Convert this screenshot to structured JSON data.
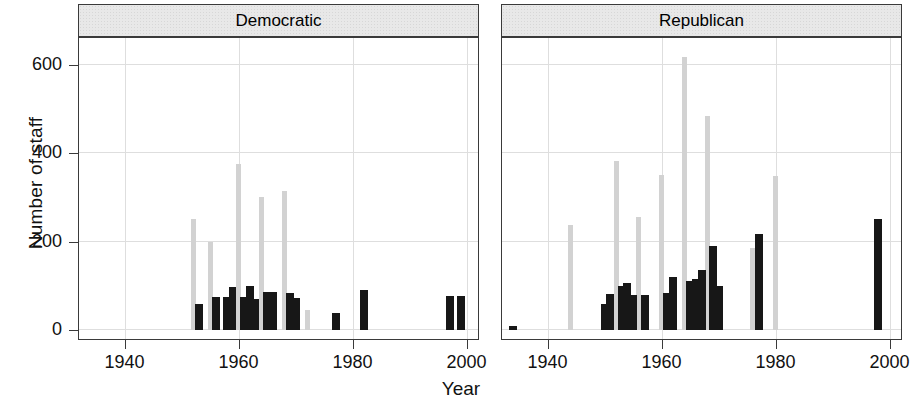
{
  "chart_data": {
    "type": "bar",
    "title": "",
    "xlabel": "Year",
    "ylabel": "Number of staff",
    "xlim": [
      1932,
      2002
    ],
    "ylim": [
      -20,
      660
    ],
    "xticks": [
      1940,
      1960,
      1980,
      2000
    ],
    "xticklabels": [
      "1940",
      "1960",
      "1980",
      "2000"
    ],
    "yticks": [
      0,
      200,
      400,
      600
    ],
    "yticklabels": [
      "0",
      "200",
      "400",
      "600"
    ],
    "grid": true,
    "legend": "none",
    "facet_variable": "party",
    "colors": {
      "light_bar": "#d2d2d2",
      "dark_bar": "#171717",
      "strip_background": "#e8e8e8",
      "border": "#3a3a3a",
      "gridline": "#dedede",
      "background": "#ffffff"
    },
    "panels": [
      {
        "label": "Democratic",
        "bars": [
          {
            "year": 1952,
            "value": 250,
            "shade": "light"
          },
          {
            "year": 1953,
            "value": 58,
            "shade": "dark"
          },
          {
            "year": 1955,
            "value": 200,
            "shade": "light"
          },
          {
            "year": 1956,
            "value": 75,
            "shade": "dark"
          },
          {
            "year": 1958,
            "value": 75,
            "shade": "dark"
          },
          {
            "year": 1959,
            "value": 98,
            "shade": "dark"
          },
          {
            "year": 1960,
            "value": 375,
            "shade": "light"
          },
          {
            "year": 1961,
            "value": 75,
            "shade": "dark"
          },
          {
            "year": 1962,
            "value": 100,
            "shade": "dark"
          },
          {
            "year": 1963,
            "value": 70,
            "shade": "dark"
          },
          {
            "year": 1964,
            "value": 300,
            "shade": "light"
          },
          {
            "year": 1965,
            "value": 86,
            "shade": "dark"
          },
          {
            "year": 1966,
            "value": 86,
            "shade": "dark"
          },
          {
            "year": 1968,
            "value": 315,
            "shade": "light"
          },
          {
            "year": 1969,
            "value": 85,
            "shade": "dark"
          },
          {
            "year": 1970,
            "value": 72,
            "shade": "dark"
          },
          {
            "year": 1972,
            "value": 45,
            "shade": "light"
          },
          {
            "year": 1977,
            "value": 38,
            "shade": "dark"
          },
          {
            "year": 1982,
            "value": 90,
            "shade": "dark"
          },
          {
            "year": 1997,
            "value": 78,
            "shade": "dark"
          },
          {
            "year": 1999,
            "value": 78,
            "shade": "dark"
          }
        ]
      },
      {
        "label": "Republican",
        "bars": [
          {
            "year": 1934,
            "value": 10,
            "shade": "dark"
          },
          {
            "year": 1944,
            "value": 237,
            "shade": "light"
          },
          {
            "year": 1950,
            "value": 58,
            "shade": "dark"
          },
          {
            "year": 1951,
            "value": 82,
            "shade": "dark"
          },
          {
            "year": 1952,
            "value": 383,
            "shade": "light"
          },
          {
            "year": 1953,
            "value": 100,
            "shade": "dark"
          },
          {
            "year": 1954,
            "value": 107,
            "shade": "dark"
          },
          {
            "year": 1956,
            "value": 255,
            "shade": "light"
          },
          {
            "year": 1955,
            "value": 80,
            "shade": "dark"
          },
          {
            "year": 1957,
            "value": 80,
            "shade": "dark"
          },
          {
            "year": 1960,
            "value": 350,
            "shade": "light"
          },
          {
            "year": 1961,
            "value": 85,
            "shade": "dark"
          },
          {
            "year": 1962,
            "value": 120,
            "shade": "dark"
          },
          {
            "year": 1964,
            "value": 617,
            "shade": "light"
          },
          {
            "year": 1965,
            "value": 112,
            "shade": "dark"
          },
          {
            "year": 1966,
            "value": 115,
            "shade": "dark"
          },
          {
            "year": 1968,
            "value": 483,
            "shade": "light"
          },
          {
            "year": 1967,
            "value": 137,
            "shade": "dark"
          },
          {
            "year": 1969,
            "value": 190,
            "shade": "dark"
          },
          {
            "year": 1970,
            "value": 100,
            "shade": "dark"
          },
          {
            "year": 1976,
            "value": 185,
            "shade": "light"
          },
          {
            "year": 1977,
            "value": 218,
            "shade": "dark"
          },
          {
            "year": 1980,
            "value": 348,
            "shade": "light"
          },
          {
            "year": 1998,
            "value": 250,
            "shade": "dark"
          }
        ]
      }
    ]
  }
}
